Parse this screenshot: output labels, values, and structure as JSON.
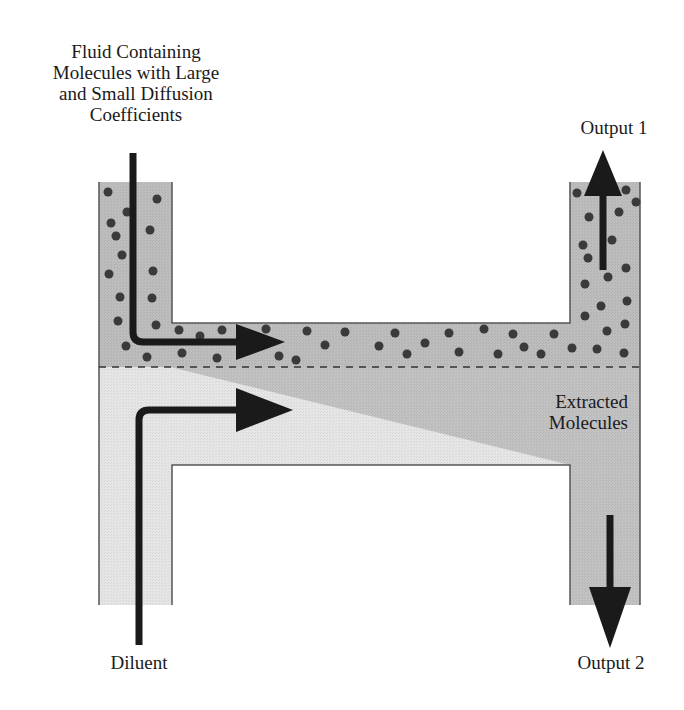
{
  "labels": {
    "input": [
      "Fluid Containing",
      "Molecules with Large",
      "and Small Diffusion",
      "Coefficients"
    ],
    "output1": "Output 1",
    "extracted": [
      "Extracted",
      "Molecules"
    ],
    "diluent": "Diluent",
    "output2": "Output 2"
  },
  "colors": {
    "sample_stream": "#bdbdbd",
    "diluent_stream": "#e6e6e6",
    "extracted_region": "#c4c4c4",
    "molecule": "#3a3a3a",
    "arrow": "#1a1a1a",
    "wall": "#555555"
  }
}
